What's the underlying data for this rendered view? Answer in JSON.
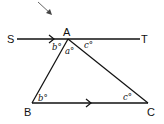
{
  "diagram": {
    "type": "geometry",
    "colors": {
      "stroke": "#111111",
      "background": "#ffffff"
    },
    "points": {
      "S": {
        "label": "S"
      },
      "T": {
        "label": "T"
      },
      "A": {
        "label": "A"
      },
      "B": {
        "label": "B"
      },
      "C": {
        "label": "C"
      }
    },
    "angles": {
      "SAB": "b°",
      "BAC": "a°",
      "TAC": "c°",
      "ABC": "b°",
      "BCA": "c°"
    },
    "parallel_marks": [
      "ST",
      "BC"
    ],
    "pointer_arrow": "arrow pointing toward A"
  }
}
